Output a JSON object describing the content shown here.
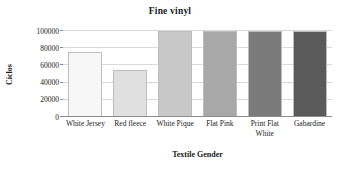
{
  "chart_data": {
    "type": "bar",
    "title": "Fine vinyl",
    "xlabel": "Textile Gender",
    "ylabel": "Ciclos",
    "categories": [
      "White Jersey",
      "Red fleece",
      "White Pique",
      "Flat Pink",
      "Print Flat White",
      "Gabardine"
    ],
    "values": [
      76000,
      55000,
      100000,
      100000,
      100000,
      100000
    ],
    "ylim": [
      0,
      100000
    ],
    "yticks": [
      0,
      20000,
      40000,
      60000,
      80000,
      100000
    ],
    "ytick_labels": [
      "0",
      "20000",
      "40000",
      "60000",
      "80000",
      "100000"
    ],
    "grid": true,
    "legend": "none",
    "bar_colors": [
      "#f7f7f7",
      "#e0e0e0",
      "#c8c8c8",
      "#a8a8a8",
      "#7a7a7a",
      "#5a5a5a"
    ],
    "bar_border_color": "#bdbdbd",
    "gridline_color": "#d9d9d9",
    "axis_color": "#8c8c8c",
    "background_color": "#ffffff"
  }
}
